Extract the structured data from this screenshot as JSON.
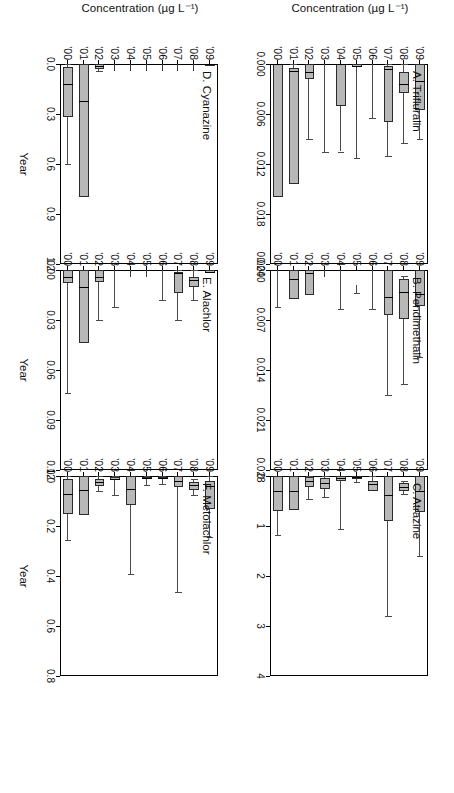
{
  "figure": {
    "axis_titles": {
      "y": "Concentration (µg L⁻¹)",
      "x": "Year"
    },
    "years": [
      "'00",
      "'01",
      "'02",
      "'03",
      "'04",
      "'05",
      "'06",
      "'07",
      "'08",
      "'09"
    ]
  },
  "chart_data": {
    "type": "box",
    "title": "",
    "xlabel": "Year",
    "ylabel": "Concentration (µg L⁻¹)",
    "grid": false,
    "legend": "none",
    "categories": [
      "'00",
      "'01",
      "'02",
      "'03",
      "'04",
      "'05",
      "'06",
      "'07",
      "'08",
      "'09"
    ],
    "panels": [
      {
        "id": "A",
        "label": "A. Trifluralin",
        "ylim": [
          0,
          0.024
        ],
        "yticks": [
          0.0,
          0.006,
          0.012,
          0.018,
          0.024
        ],
        "ytick_labels": [
          "0.000",
          "0.006",
          "0.012",
          "0.018",
          "0.024"
        ],
        "boxes": [
          {
            "year": "'00",
            "whisker_low": 0.0,
            "q1": 0.0,
            "median": 0.0,
            "q3": 0.016,
            "whisker_high": 0.016,
            "lower_whisker_cap": 0.009
          },
          {
            "year": "'01",
            "whisker_low": 0.0,
            "q1": 0.0005,
            "median": 0.0008,
            "q3": 0.0144,
            "whisker_high": 0.0144
          },
          {
            "year": "'02",
            "whisker_low": 0.0,
            "q1": 0.0,
            "median": 0.0009,
            "q3": 0.0018,
            "whisker_high": 0.009
          },
          {
            "year": "'03",
            "whisker_low": 0.0,
            "q1": 0.0,
            "median": 0.0,
            "q3": 0.0,
            "whisker_high": 0.0105
          },
          {
            "year": "'04",
            "whisker_low": 0.0,
            "q1": 0.0,
            "median": 0.0,
            "q3": 0.005,
            "whisker_high": 0.0105
          },
          {
            "year": "'05",
            "whisker_low": 0.0,
            "q1": 0.0,
            "median": 0.0002,
            "q3": 0.0004,
            "whisker_high": 0.0113
          },
          {
            "year": "'06",
            "whisker_low": 0.0,
            "q1": 0.0,
            "median": 0.0,
            "q3": 0.0,
            "whisker_high": 0.0065
          },
          {
            "year": "'07",
            "whisker_low": 0.0,
            "q1": 0.0002,
            "median": 0.0006,
            "q3": 0.007,
            "whisker_high": 0.011
          },
          {
            "year": "'08",
            "whisker_low": 0.0,
            "q1": 0.001,
            "median": 0.0024,
            "q3": 0.0035,
            "whisker_high": 0.0095
          },
          {
            "year": "'09",
            "whisker_low": 0.0,
            "q1": 0.0,
            "median": 0.002,
            "q3": 0.0055,
            "whisker_high": 0.009
          }
        ]
      },
      {
        "id": "B",
        "label": "B. Pendimethalin",
        "ylim": [
          0,
          0.028
        ],
        "yticks": [
          0.0,
          0.007,
          0.014,
          0.021,
          0.028
        ],
        "ytick_labels": [
          "0.000",
          "0.007",
          "0.014",
          "0.021",
          "0.028"
        ],
        "boxes": [
          {
            "year": "'00",
            "whisker_low": 0.0,
            "q1": 0.0,
            "median": 0.0,
            "q3": 0.0,
            "whisker_high": 0.0052
          },
          {
            "year": "'01",
            "whisker_low": 0.0,
            "q1": 0.0,
            "median": 0.0013,
            "q3": 0.004,
            "whisker_high": 0.004
          },
          {
            "year": "'02",
            "whisker_low": 0.0,
            "q1": 0.0,
            "median": 0.0004,
            "q3": 0.0035,
            "whisker_high": 0.0035
          },
          {
            "year": "'03",
            "whisker_low": 0.0,
            "q1": 0.0,
            "median": 0.0,
            "q3": 0.0,
            "whisker_high": 0.0
          },
          {
            "year": "'04",
            "whisker_low": 0.0,
            "q1": 0.0,
            "median": 0.0,
            "q3": 0.0,
            "whisker_high": 0.0054
          },
          {
            "year": "'05",
            "whisker_low": 0.0021,
            "q1": 0.0021,
            "median": 0.0021,
            "q3": 0.0021,
            "whisker_high": 0.0032
          },
          {
            "year": "'06",
            "whisker_low": 0.0,
            "q1": 0.0,
            "median": 0.0,
            "q3": 0.0,
            "whisker_high": 0.0055
          },
          {
            "year": "'07",
            "whisker_low": 0.0,
            "q1": 0.0,
            "median": 0.0038,
            "q3": 0.0063,
            "whisker_high": 0.0175
          },
          {
            "year": "'08",
            "whisker_low": 0.0009,
            "q1": 0.0013,
            "median": 0.0031,
            "q3": 0.0068,
            "whisker_high": 0.016
          },
          {
            "year": "'09",
            "whisker_low": 0.0,
            "q1": 0.0,
            "median": 0.0034,
            "q3": 0.005,
            "whisker_high": 0.0122
          }
        ]
      },
      {
        "id": "C",
        "label": "C. Atrazine",
        "ylim": [
          0,
          4
        ],
        "yticks": [
          0,
          1,
          2,
          3,
          4
        ],
        "ytick_labels": [
          "0",
          "1",
          "2",
          "3",
          "4"
        ],
        "boxes": [
          {
            "year": "'00",
            "whisker_low": 0.0,
            "q1": 0.0,
            "median": 0.3,
            "q3": 0.7,
            "whisker_high": 1.18
          },
          {
            "year": "'01",
            "whisker_low": 0.0,
            "q1": 0.0,
            "median": 0.3,
            "q3": 0.68,
            "whisker_high": 0.68
          },
          {
            "year": "'02",
            "whisker_low": 0.0,
            "q1": 0.02,
            "median": 0.1,
            "q3": 0.22,
            "whisker_high": 0.46
          },
          {
            "year": "'03",
            "whisker_low": 0.0,
            "q1": 0.04,
            "median": 0.14,
            "q3": 0.26,
            "whisker_high": 0.42
          },
          {
            "year": "'04",
            "whisker_low": 0.0,
            "q1": 0.0,
            "median": 0.03,
            "q3": 0.09,
            "whisker_high": 1.05
          },
          {
            "year": "'05",
            "whisker_low": 0.0,
            "q1": 0.0,
            "median": 0.02,
            "q3": 0.05,
            "whisker_high": 0.12
          },
          {
            "year": "'06",
            "whisker_low": 0.0,
            "q1": 0.1,
            "median": 0.16,
            "q3": 0.29,
            "whisker_high": 0.29
          },
          {
            "year": "'07",
            "whisker_low": 0.0,
            "q1": 0.0,
            "median": 0.38,
            "q3": 0.9,
            "whisker_high": 2.8
          },
          {
            "year": "'08",
            "whisker_low": 0.1,
            "q1": 0.14,
            "median": 0.22,
            "q3": 0.3,
            "whisker_high": 0.36
          },
          {
            "year": "'09",
            "whisker_low": 0.0,
            "q1": 0.0,
            "median": 0.3,
            "q3": 0.72,
            "whisker_high": 1.6
          }
        ]
      },
      {
        "id": "D",
        "label": "D. Cyanazine",
        "ylim": [
          0,
          1.2
        ],
        "yticks": [
          0.0,
          0.3,
          0.6,
          0.9,
          1.2
        ],
        "ytick_labels": [
          "0.0",
          "0.3",
          "0.6",
          "0.9",
          "1.2"
        ],
        "boxes": [
          {
            "year": "'00",
            "whisker_low": 0.0,
            "q1": 0.02,
            "median": 0.12,
            "q3": 0.32,
            "whisker_high": 0.6
          },
          {
            "year": "'01",
            "whisker_low": 0.0,
            "q1": 0.0,
            "median": 0.22,
            "q3": 0.8,
            "whisker_high": 0.8
          },
          {
            "year": "'02",
            "whisker_low": 0.0,
            "q1": 0.0,
            "median": 0.01,
            "q3": 0.03,
            "whisker_high": 0.04
          },
          {
            "year": "'03",
            "whisker_low": 0.0,
            "q1": 0.0,
            "median": 0.0,
            "q3": 0.0,
            "whisker_high": 0.0
          },
          {
            "year": "'04",
            "whisker_low": 0.0,
            "q1": 0.0,
            "median": 0.0,
            "q3": 0.0,
            "whisker_high": 0.0
          },
          {
            "year": "'05",
            "whisker_low": 0.0,
            "q1": 0.0,
            "median": 0.0,
            "q3": 0.0,
            "whisker_high": 0.0
          },
          {
            "year": "'06",
            "whisker_low": 0.0,
            "q1": 0.0,
            "median": 0.0,
            "q3": 0.0,
            "whisker_high": 0.0
          },
          {
            "year": "'07",
            "whisker_low": 0.0,
            "q1": 0.0,
            "median": 0.0,
            "q3": 0.0,
            "whisker_high": 0.0
          },
          {
            "year": "'08",
            "whisker_low": 0.0,
            "q1": 0.0,
            "median": 0.0,
            "q3": 0.0,
            "whisker_high": 0.0
          },
          {
            "year": "'09",
            "whisker_low": 0.0,
            "q1": 0.0,
            "median": 0.0,
            "q3": 0.01,
            "whisker_high": 0.01
          }
        ]
      },
      {
        "id": "E",
        "label": "E. Alachlor",
        "ylim": [
          0,
          0.12
        ],
        "yticks": [
          0.0,
          0.03,
          0.06,
          0.09,
          0.12
        ],
        "ytick_labels": [
          "0.00",
          "0.03",
          "0.06",
          "0.09",
          "0.12"
        ],
        "boxes": [
          {
            "year": "'00",
            "whisker_low": 0.0,
            "q1": 0.0,
            "median": 0.004,
            "q3": 0.008,
            "whisker_high": 0.074
          },
          {
            "year": "'01",
            "whisker_low": 0.0,
            "q1": 0.0,
            "median": 0.01,
            "q3": 0.044,
            "whisker_high": 0.044
          },
          {
            "year": "'02",
            "whisker_low": 0.0,
            "q1": 0.0,
            "median": 0.004,
            "q3": 0.007,
            "whisker_high": 0.03
          },
          {
            "year": "'03",
            "whisker_low": 0.0,
            "q1": 0.0,
            "median": 0.0,
            "q3": 0.0,
            "whisker_high": 0.022
          },
          {
            "year": "'04",
            "whisker_low": 0.0,
            "q1": 0.0,
            "median": 0.0,
            "q3": 0.0,
            "whisker_high": 0.0
          },
          {
            "year": "'05",
            "whisker_low": 0.0,
            "q1": 0.0,
            "median": 0.0,
            "q3": 0.0,
            "whisker_high": 0.0
          },
          {
            "year": "'06",
            "whisker_low": 0.0,
            "q1": 0.0,
            "median": 0.0,
            "q3": 0.0,
            "whisker_high": 0.018
          },
          {
            "year": "'07",
            "whisker_low": 0.0,
            "q1": 0.001,
            "median": 0.002,
            "q3": 0.014,
            "whisker_high": 0.03
          },
          {
            "year": "'08",
            "whisker_low": 0.0,
            "q1": 0.004,
            "median": 0.006,
            "q3": 0.01,
            "whisker_high": 0.018
          },
          {
            "year": "'09",
            "whisker_low": 0.0,
            "q1": 0.0,
            "median": 0.001,
            "q3": 0.002,
            "whisker_high": 0.002
          }
        ]
      },
      {
        "id": "F",
        "label": "F. Metolachlor",
        "ylim": [
          0,
          0.8
        ],
        "yticks": [
          0.0,
          0.2,
          0.4,
          0.6,
          0.8
        ],
        "ytick_labels": [
          "0.0",
          "0.2",
          "0.4",
          "0.6",
          "0.8"
        ],
        "boxes": [
          {
            "year": "'00",
            "whisker_low": 0.0,
            "q1": 0.01,
            "median": 0.07,
            "q3": 0.15,
            "whisker_high": 0.255
          },
          {
            "year": "'01",
            "whisker_low": 0.0,
            "q1": 0.0,
            "median": 0.055,
            "q3": 0.155,
            "whisker_high": 0.155
          },
          {
            "year": "'02",
            "whisker_low": 0.0,
            "q1": 0.012,
            "median": 0.025,
            "q3": 0.04,
            "whisker_high": 0.06
          },
          {
            "year": "'03",
            "whisker_low": 0.0,
            "q1": 0.005,
            "median": 0.01,
            "q3": 0.016,
            "whisker_high": 0.075
          },
          {
            "year": "'04",
            "whisker_low": 0.0,
            "q1": 0.0,
            "median": 0.05,
            "q3": 0.115,
            "whisker_high": 0.39
          },
          {
            "year": "'05",
            "whisker_low": 0.0,
            "q1": 0.004,
            "median": 0.008,
            "q3": 0.012,
            "whisker_high": 0.035
          },
          {
            "year": "'06",
            "whisker_low": 0.0,
            "q1": 0.004,
            "median": 0.008,
            "q3": 0.013,
            "whisker_high": 0.03
          },
          {
            "year": "'07",
            "whisker_low": 0.0,
            "q1": 0.0,
            "median": 0.02,
            "q3": 0.045,
            "whisker_high": 0.465
          },
          {
            "year": "'08",
            "whisker_low": 0.01,
            "q1": 0.022,
            "median": 0.035,
            "q3": 0.055,
            "whisker_high": 0.075
          },
          {
            "year": "'09",
            "whisker_low": 0.0,
            "q1": 0.02,
            "median": 0.04,
            "q3": 0.13,
            "whisker_high": 0.245
          }
        ]
      }
    ]
  }
}
